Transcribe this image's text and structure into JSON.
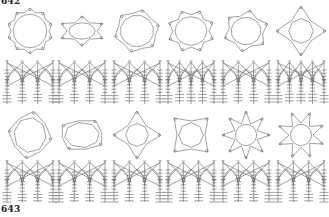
{
  "figure": {
    "labels": {
      "top": "642",
      "bottom": "643"
    },
    "colors": {
      "ink": "#7a7a7a",
      "ink_dark": "#5e5e5e",
      "paper": "#ffffff",
      "label": "#222222"
    },
    "rows": [
      {
        "figure_number": "642",
        "plan_y": 31,
        "elev_top": 60,
        "elev_bottom": 104,
        "panels": [
          {
            "cx": 30,
            "type": "star-polygon",
            "points": 10,
            "r_outer": 23,
            "r_inner": 19,
            "rot": 0,
            "sx": 1.0,
            "sy": 1.0,
            "piers": 4
          },
          {
            "cx": 82,
            "type": "star-polygon",
            "points": 6,
            "r_outer": 24,
            "r_inner": 15,
            "rot": 0,
            "sx": 1.0,
            "sy": 0.62,
            "piers": 4
          },
          {
            "cx": 137,
            "type": "star-polygon",
            "points": 6,
            "r_outer": 23,
            "r_inner": 19,
            "rot": 15,
            "sx": 1.0,
            "sy": 0.95,
            "piers": 4
          },
          {
            "cx": 191,
            "type": "star-polygon",
            "points": 8,
            "r_outer": 24,
            "r_inner": 18,
            "rot": 22,
            "sx": 1.0,
            "sy": 0.9,
            "piers": 5
          },
          {
            "cx": 246,
            "type": "star-polygon",
            "points": 6,
            "r_outer": 23,
            "r_inner": 17,
            "rot": 10,
            "sx": 1.0,
            "sy": 0.92,
            "piers": 4
          },
          {
            "cx": 301,
            "type": "star-polygon",
            "points": 4,
            "r_outer": 25,
            "r_inner": 14,
            "rot": 0,
            "sx": 1.0,
            "sy": 1.0,
            "piers": 5
          }
        ]
      },
      {
        "figure_number": "643",
        "plan_y": 135,
        "elev_top": 160,
        "elev_bottom": 202,
        "panels": [
          {
            "cx": 30,
            "type": "star-polygon",
            "points": 4,
            "r_outer": 24,
            "r_inner": 20,
            "rot": 10,
            "sx": 0.92,
            "sy": 1.0,
            "piers": 4
          },
          {
            "cx": 82,
            "type": "star-polygon",
            "points": 4,
            "r_outer": 24,
            "r_inner": 20,
            "rot": 35,
            "sx": 1.0,
            "sy": 0.72,
            "piers": 4
          },
          {
            "cx": 137,
            "type": "star-polygon",
            "points": 4,
            "r_outer": 24,
            "r_inner": 13,
            "rot": 0,
            "sx": 1.0,
            "sy": 1.0,
            "piers": 4
          },
          {
            "cx": 191,
            "type": "star-polygon",
            "points": 4,
            "r_outer": 24,
            "r_inner": 14,
            "rot": 45,
            "sx": 1.0,
            "sy": 1.0,
            "piers": 4
          },
          {
            "cx": 246,
            "type": "star-polygon",
            "points": 8,
            "r_outer": 24,
            "r_inner": 12,
            "rot": 0,
            "sx": 1.0,
            "sy": 1.0,
            "piers": 4
          },
          {
            "cx": 301,
            "type": "star-polygon",
            "points": 8,
            "r_outer": 24,
            "r_inner": 12,
            "rot": 22,
            "sx": 1.0,
            "sy": 1.0,
            "piers": 4
          }
        ]
      }
    ]
  }
}
